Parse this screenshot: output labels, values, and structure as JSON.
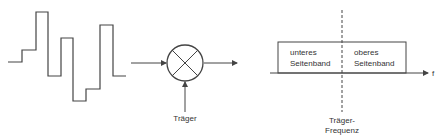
{
  "diagram": {
    "colors": {
      "line": "#444444",
      "text": "#333333",
      "background": "#ffffff"
    },
    "input_signal": {
      "type": "step-waveform",
      "points": [
        [
          8,
          62
        ],
        [
          22,
          62
        ],
        [
          22,
          50
        ],
        [
          36,
          50
        ],
        [
          36,
          12
        ],
        [
          48,
          12
        ],
        [
          48,
          76
        ],
        [
          61,
          76
        ],
        [
          61,
          38
        ],
        [
          73,
          38
        ],
        [
          73,
          101
        ],
        [
          86,
          101
        ],
        [
          86,
          89
        ],
        [
          100,
          89
        ],
        [
          100,
          25
        ],
        [
          113,
          25
        ],
        [
          113,
          76
        ],
        [
          126,
          76
        ]
      ]
    },
    "mixer": {
      "symbol": "multiplier-circle",
      "carrier_label": "Träger"
    },
    "spectrum": {
      "lower_sideband_line1": "unteres",
      "lower_sideband_line2": "Seitenband",
      "upper_sideband_line1": "oberes",
      "upper_sideband_line2": "Seitenband",
      "axis_label": "f",
      "carrier_freq_line1": "Träger-",
      "carrier_freq_line2": "Frequenz"
    }
  }
}
